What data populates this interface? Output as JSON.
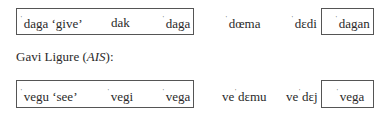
{
  "row1": {
    "items": [
      {
        "stress": "ˈ",
        "form": "daga",
        "gloss": "‘give’"
      },
      {
        "stress": "",
        "form": "dak",
        "gloss": ""
      },
      {
        "stress": "ˈ",
        "form": "daga",
        "gloss": ""
      },
      {
        "stress": "ˈ",
        "form": "dœma",
        "gloss": ""
      },
      {
        "stress": "ˈ",
        "form": "dɛdi",
        "gloss": ""
      },
      {
        "stress": "ˈ",
        "form": "dagan",
        "gloss": ""
      }
    ]
  },
  "heading": {
    "prefix": "Gavi Ligure (",
    "source": "AIS",
    "suffix": "):"
  },
  "row2": {
    "items": [
      {
        "pre": "",
        "stress": "ˈ",
        "form": "vegu",
        "gloss": "‘see’"
      },
      {
        "pre": "",
        "stress": "ˈ",
        "form": "vegi",
        "gloss": ""
      },
      {
        "pre": "",
        "stress": "ˈ",
        "form": "vega",
        "gloss": ""
      },
      {
        "pre": "ve",
        "stress": "ˈ",
        "form": "dɛmu",
        "gloss": ""
      },
      {
        "pre": "ve",
        "stress": "ˈ",
        "form": "dɛj",
        "gloss": ""
      },
      {
        "pre": "",
        "stress": "ˈ",
        "form": "vega",
        "gloss": ""
      }
    ]
  }
}
